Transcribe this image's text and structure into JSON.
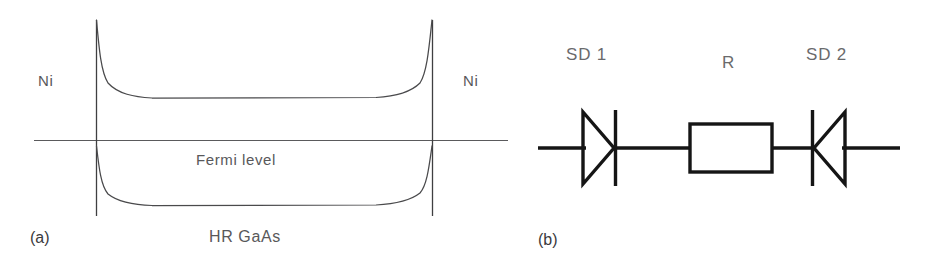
{
  "figure": {
    "width": 929,
    "height": 273,
    "background": "#ffffff",
    "ink_light": "#58585a",
    "ink_dark": "#1a1a1a",
    "curve_color": "#4a4a4c"
  },
  "panel_a": {
    "tag": "(a)",
    "type": "energy-band-diagram",
    "left_contact_label": "Ni",
    "right_contact_label": "Ni",
    "fermi_label": "Fermi level",
    "substrate_label": "HR GaAs",
    "description": "Back-to-back Schottky barrier band diagram for Ni / HR GaAs / Ni",
    "geometry": {
      "left_interface_x": 96,
      "right_interface_x": 432,
      "interface_top_y": 20,
      "interface_bottom_y": 216,
      "fermi_line_y": 140,
      "fermi_line_x_start": 34,
      "fermi_line_x_end": 508,
      "conduction_flat_y": 98,
      "valence_flat_y": 205,
      "band_flat_x_start": 150,
      "band_flat_x_end": 380
    }
  },
  "panel_b": {
    "tag": "(b)",
    "type": "equivalent-circuit",
    "description": "Equivalent circuit: two opposing Schottky diodes in series with a resistor",
    "components": [
      {
        "name": "SD 1",
        "kind": "schottky-diode",
        "orientation": "anode-left-cathode-right",
        "label_x": 566,
        "label_y": 54,
        "center_x": 604,
        "center_y": 148
      },
      {
        "name": "R",
        "kind": "resistor",
        "orientation": "horizontal",
        "label_x": 722,
        "label_y": 62,
        "box_x": 690,
        "box_y": 124,
        "box_w": 82,
        "box_h": 48
      },
      {
        "name": "SD 2",
        "kind": "schottky-diode",
        "orientation": "cathode-left-anode-right",
        "label_x": 806,
        "label_y": 54,
        "center_x": 830,
        "center_y": 148
      }
    ],
    "wire": {
      "y": 148,
      "x_start": 538,
      "x_end": 900
    }
  }
}
